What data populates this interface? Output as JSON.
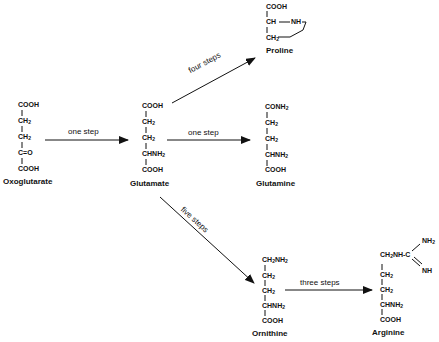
{
  "molecules": {
    "oxoglutarate": {
      "name": "Oxoglutarate",
      "lines": [
        "COOH",
        "CH2",
        "CH2",
        "C=O",
        "COOH"
      ]
    },
    "glutamate": {
      "name": "Glutamate",
      "lines": [
        "COOH",
        "CH2",
        "CH2",
        "CHNH2",
        "COOH"
      ]
    },
    "proline": {
      "name": "Proline",
      "lines": [
        "COOH",
        "CH",
        "NH",
        "CH2"
      ]
    },
    "glutamine": {
      "name": "Glutamine",
      "lines": [
        "CONH2",
        "CH2",
        "CH2",
        "CHNH2",
        "COOH"
      ]
    },
    "ornithine": {
      "name": "Ornithine",
      "lines": [
        "CH2NH2",
        "CH2",
        "CH2",
        "CHNH2",
        "COOH"
      ]
    },
    "arginine": {
      "name": "Arginine",
      "lines": [
        "CH2NH-C",
        "NH2",
        "NH",
        "CH2",
        "CH2",
        "CHNH2",
        "COOH"
      ]
    }
  },
  "arrows": {
    "oxo_to_glu": "one step",
    "glu_to_pro": "four steps",
    "glu_to_gln": "one step",
    "glu_to_orn": "five steps",
    "orn_to_arg": "three steps"
  }
}
